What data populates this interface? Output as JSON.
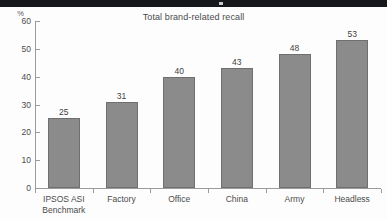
{
  "slide": {
    "background_color": "#fdfdfd",
    "top_band_color": "#16171a"
  },
  "chart_data": {
    "type": "bar",
    "title": "Total brand-related recall",
    "xlabel": "",
    "ylabel": "%",
    "y_unit_label": "%",
    "categories": [
      "IPSOS ASI\nBenchmark",
      "Factory",
      "Office",
      "China",
      "Army",
      "Headless"
    ],
    "category_labels_flat": [
      "IPSOS ASI Benchmark",
      "Factory",
      "Office",
      "China",
      "Army",
      "Headless"
    ],
    "values": [
      25,
      31,
      40,
      43,
      48,
      53
    ],
    "data_labels": [
      "25",
      "31",
      "40",
      "43",
      "48",
      "53"
    ],
    "ylim": [
      0,
      60
    ],
    "yticks": [
      0,
      10,
      20,
      30,
      40,
      50,
      60
    ],
    "ytick_labels": [
      "0",
      "10",
      "20",
      "30",
      "40",
      "50",
      "60"
    ],
    "grid": false,
    "legend": false,
    "legend_position": "none",
    "bar_fill_color": "#8b8b8b",
    "bar_border_color": "#6f6f6f",
    "axis_color": "#9b9b9b",
    "text_color": "#4b4b4b",
    "value_label_color": "#3f3f3f",
    "title_color": "#4b4b4b"
  }
}
